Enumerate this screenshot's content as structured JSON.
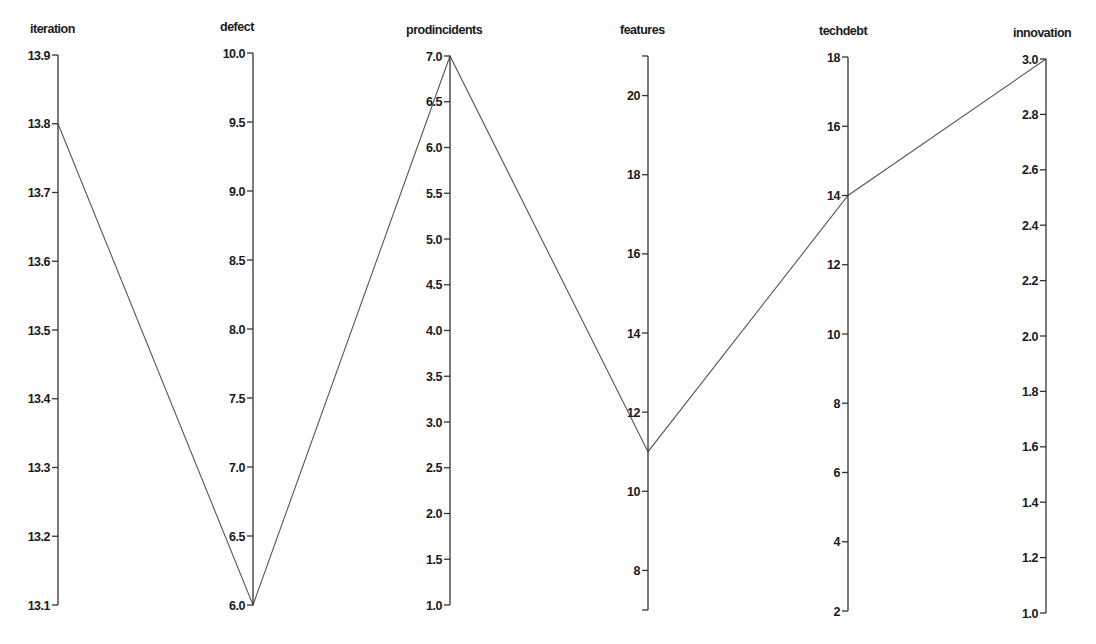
{
  "chart_data": {
    "type": "parallel_coordinates",
    "title": "",
    "dimensions": [
      {
        "name": "iteration",
        "x": 58,
        "range": [
          13.1,
          13.9
        ],
        "y_top": 55,
        "y_bottom": 605,
        "ticks": [
          13.1,
          13.2,
          13.3,
          13.4,
          13.5,
          13.6,
          13.7,
          13.8,
          13.9
        ],
        "tick_decimals": 1,
        "title_dx": -28
      },
      {
        "name": "defect",
        "x": 253,
        "range": [
          6.0,
          10.0
        ],
        "y_top": 53,
        "y_bottom": 605,
        "ticks": [
          6.0,
          6.5,
          7.0,
          7.5,
          8.0,
          8.5,
          9.0,
          9.5,
          10.0
        ],
        "tick_decimals": 1,
        "title_dx": -33
      },
      {
        "name": "prodincidents",
        "x": 450,
        "range": [
          1.0,
          7.0
        ],
        "y_top": 56,
        "y_bottom": 605,
        "ticks": [
          1.0,
          1.5,
          2.0,
          2.5,
          3.0,
          3.5,
          4.0,
          4.5,
          5.0,
          5.5,
          6.0,
          6.5,
          7.0
        ],
        "tick_decimals": 1,
        "title_dx": -44
      },
      {
        "name": "features",
        "x": 648,
        "range": [
          7,
          21
        ],
        "y_top": 56,
        "y_bottom": 610,
        "ticks": [
          8,
          10,
          12,
          14,
          16,
          18,
          20
        ],
        "tick_decimals": 0,
        "title_dx": -28,
        "end_ticks": true
      },
      {
        "name": "techdebt",
        "x": 848,
        "range": [
          2,
          18
        ],
        "y_top": 57,
        "y_bottom": 611,
        "ticks": [
          2,
          4,
          6,
          8,
          10,
          12,
          14,
          16,
          18
        ],
        "tick_decimals": 0,
        "title_dx": -29
      },
      {
        "name": "innovation",
        "x": 1046,
        "range": [
          1.0,
          3.0
        ],
        "y_top": 59,
        "y_bottom": 613,
        "ticks": [
          1.0,
          1.2,
          1.4,
          1.6,
          1.8,
          2.0,
          2.2,
          2.4,
          2.6,
          2.8,
          3.0
        ],
        "tick_decimals": 1,
        "title_dx": -33
      }
    ],
    "records": [
      {
        "iteration": 13.8,
        "defect": 6.0,
        "prodincidents": 7.0,
        "features": 11,
        "techdebt": 14,
        "innovation": 3.0
      }
    ],
    "line_color": "#555555",
    "grid": false,
    "legend": null
  }
}
